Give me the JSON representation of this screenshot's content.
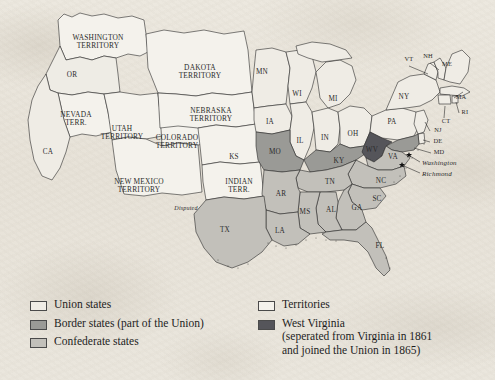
{
  "map": {
    "title": "United States during the Civil War",
    "colors": {
      "union": "#efece5",
      "territory": "#f4f2ec",
      "border_state": "#9a9a96",
      "confederate": "#c2c0ba",
      "west_virginia": "#55555a",
      "ocean": "#f2efe8",
      "outline": "#2a2a2a"
    },
    "state_labels": [
      {
        "id": "OR",
        "text": "OR",
        "x": 72,
        "y": 75,
        "cls": "lbl-st"
      },
      {
        "id": "CA",
        "text": "CA",
        "x": 48,
        "y": 152,
        "cls": "lbl-st"
      },
      {
        "id": "MN",
        "text": "MN",
        "x": 262,
        "y": 72,
        "cls": "lbl-st"
      },
      {
        "id": "WI",
        "text": "WI",
        "x": 297,
        "y": 94,
        "cls": "lbl-st"
      },
      {
        "id": "MI",
        "text": "MI",
        "x": 333,
        "y": 99,
        "cls": "lbl-st"
      },
      {
        "id": "IA",
        "text": "IA",
        "x": 270,
        "y": 122,
        "cls": "lbl-st"
      },
      {
        "id": "IL",
        "text": "IL",
        "x": 300,
        "y": 141,
        "cls": "lbl-st"
      },
      {
        "id": "IN",
        "text": "IN",
        "x": 325,
        "y": 138,
        "cls": "lbl-st"
      },
      {
        "id": "OH",
        "text": "OH",
        "x": 353,
        "y": 134,
        "cls": "lbl-st"
      },
      {
        "id": "PA",
        "text": "PA",
        "x": 392,
        "y": 122,
        "cls": "lbl-st"
      },
      {
        "id": "NY",
        "text": "NY",
        "x": 404,
        "y": 97,
        "cls": "lbl-st"
      },
      {
        "id": "KS",
        "text": "KS",
        "x": 234,
        "y": 157,
        "cls": "lbl-st"
      },
      {
        "id": "MO",
        "text": "MO",
        "x": 275,
        "y": 152,
        "cls": "lbl-st"
      },
      {
        "id": "KY",
        "text": "KY",
        "x": 339,
        "y": 161,
        "cls": "lbl-st"
      },
      {
        "id": "WV",
        "text": "WV",
        "x": 372,
        "y": 150,
        "cls": "lbl-st"
      },
      {
        "id": "VA",
        "text": "VA",
        "x": 393,
        "y": 157,
        "cls": "lbl-st"
      },
      {
        "id": "TN",
        "text": "TN",
        "x": 330,
        "y": 182,
        "cls": "lbl-st"
      },
      {
        "id": "NC",
        "text": "NC",
        "x": 381,
        "y": 181,
        "cls": "lbl-st"
      },
      {
        "id": "SC",
        "text": "SC",
        "x": 377,
        "y": 199,
        "cls": "lbl-st"
      },
      {
        "id": "GA",
        "text": "GA",
        "x": 357,
        "y": 208,
        "cls": "lbl-st"
      },
      {
        "id": "AL",
        "text": "AL",
        "x": 331,
        "y": 210,
        "cls": "lbl-st"
      },
      {
        "id": "MS",
        "text": "MS",
        "x": 305,
        "y": 212,
        "cls": "lbl-st"
      },
      {
        "id": "AR",
        "text": "AR",
        "x": 281,
        "y": 194,
        "cls": "lbl-st"
      },
      {
        "id": "LA",
        "text": "LA",
        "x": 280,
        "y": 231,
        "cls": "lbl-st"
      },
      {
        "id": "TX",
        "text": "TX",
        "x": 225,
        "y": 230,
        "cls": "lbl-st"
      },
      {
        "id": "FL",
        "text": "FL",
        "x": 380,
        "y": 246,
        "cls": "lbl-st"
      },
      {
        "id": "VT",
        "text": "VT",
        "x": 409,
        "y": 60,
        "cls": "lbl-sm"
      },
      {
        "id": "NH",
        "text": "NH",
        "x": 428,
        "y": 57,
        "cls": "lbl-sm"
      },
      {
        "id": "ME",
        "text": "ME",
        "x": 447,
        "y": 65,
        "cls": "lbl-sm"
      },
      {
        "id": "MA",
        "text": "MA",
        "x": 461,
        "y": 98,
        "cls": "lbl-sm"
      },
      {
        "id": "RI",
        "text": "RI",
        "x": 465,
        "y": 113,
        "cls": "lbl-sm"
      },
      {
        "id": "CT",
        "text": "CT",
        "x": 446,
        "y": 122,
        "cls": "lbl-sm"
      },
      {
        "id": "NJ",
        "text": "NJ",
        "x": 438,
        "y": 131,
        "cls": "lbl-sm"
      },
      {
        "id": "DE",
        "text": "DE",
        "x": 438,
        "y": 142,
        "cls": "lbl-sm"
      },
      {
        "id": "MD",
        "text": "MD",
        "x": 439,
        "y": 153,
        "cls": "lbl-sm"
      }
    ],
    "territory_labels": [
      {
        "id": "washington-territory",
        "lines": [
          "WASHINGTON",
          "TERRITORY"
        ],
        "x": 98,
        "y": 42
      },
      {
        "id": "dakota-territory",
        "lines": [
          "DAKOTA",
          "TERRITORY"
        ],
        "x": 200,
        "y": 72
      },
      {
        "id": "nebraska-territory",
        "lines": [
          "NEBRASKA",
          "TERRITORY"
        ],
        "x": 211,
        "y": 115
      },
      {
        "id": "nevada-territory",
        "lines": [
          "NEVADA",
          "TERR."
        ],
        "x": 76,
        "y": 119
      },
      {
        "id": "utah-territory",
        "lines": [
          "UTAH",
          "TERRITORY"
        ],
        "x": 122,
        "y": 133
      },
      {
        "id": "colorado-territory",
        "lines": [
          "COLORADO",
          "TERRITORY"
        ],
        "x": 177,
        "y": 142
      },
      {
        "id": "new-mexico-territory",
        "lines": [
          "NEW MEXICO",
          "TERRITORY"
        ],
        "x": 139,
        "y": 186
      },
      {
        "id": "indian-territory",
        "lines": [
          "INDIAN",
          "TERR."
        ],
        "x": 239,
        "y": 186
      }
    ],
    "city_labels": [
      {
        "id": "washington",
        "text": "Washington",
        "x": 422,
        "y": 163
      },
      {
        "id": "richmond",
        "text": "Richmond",
        "x": 422,
        "y": 174
      }
    ],
    "annotations": [
      {
        "id": "disputed",
        "text": "Disputed",
        "x": 186,
        "y": 209
      }
    ]
  },
  "legend": {
    "left_column": [
      {
        "id": "union-states",
        "label": "Union states",
        "swatch": "#efece5"
      },
      {
        "id": "border-states",
        "label": "Border states (part of the Union)",
        "swatch": "#9a9a96"
      },
      {
        "id": "confederate-states",
        "label": "Confederate states",
        "swatch": "#c2c0ba"
      }
    ],
    "right_column": [
      {
        "id": "territories",
        "label": "Territories",
        "swatch": "#f4f2ec",
        "sub": []
      },
      {
        "id": "west-virginia",
        "label": "West Virginia",
        "swatch": "#55555a",
        "sub": [
          "(seperated from Virginia in 1861",
          "and joined the Union in 1865)"
        ]
      }
    ]
  }
}
